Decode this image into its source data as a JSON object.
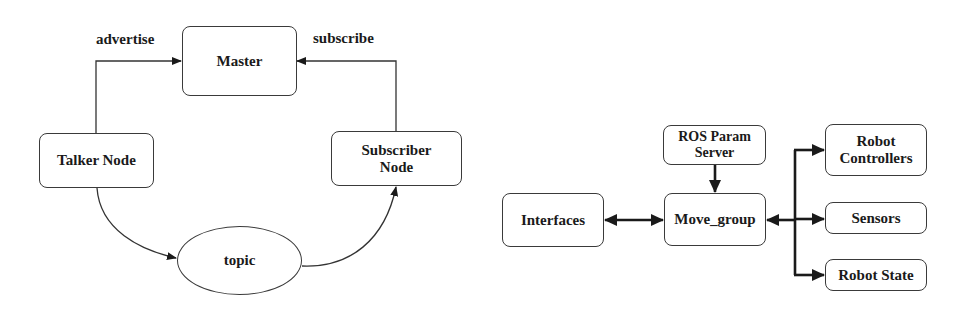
{
  "left_diagram": {
    "nodes": {
      "master": "Master",
      "talker": "Talker Node",
      "subscriber": "Subscriber\nNode",
      "topic": "topic"
    },
    "edge_labels": {
      "advertise": "advertise",
      "subscribe": "subscribe"
    },
    "edges": [
      {
        "from": "Talker Node",
        "to": "Master",
        "label": "advertise"
      },
      {
        "from": "Subscriber Node",
        "to": "Master",
        "label": "subscribe"
      },
      {
        "from": "Talker Node",
        "to": "topic"
      },
      {
        "from": "topic",
        "to": "Subscriber Node"
      }
    ]
  },
  "right_diagram": {
    "nodes": {
      "param_server": "ROS Param\nServer",
      "interfaces": "Interfaces",
      "move_group": "Move_group",
      "controllers": "Robot\nControllers",
      "sensors": "Sensors",
      "robot_state": "Robot State"
    },
    "edges": [
      {
        "from": "ROS Param Server",
        "to": "Move_group"
      },
      {
        "from": "Interfaces",
        "to": "Move_group",
        "bidirectional": true
      },
      {
        "from": "Move_group",
        "to": "Robot Controllers",
        "bidirectional": true
      },
      {
        "from": "Move_group",
        "to": "Sensors",
        "bidirectional": true
      },
      {
        "from": "Move_group",
        "to": "Robot State",
        "bidirectional": true
      }
    ]
  }
}
